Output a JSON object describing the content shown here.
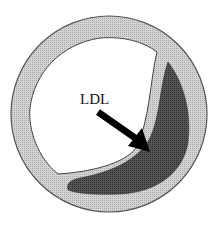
{
  "diagram": {
    "labels": {
      "ldl": "LDL"
    },
    "parts": [
      {
        "id": "vessel-wall",
        "description": "outer arterial wall ring (light stippled gray)"
      },
      {
        "id": "lumen",
        "description": "open white lumen"
      },
      {
        "id": "plaque",
        "description": "dark crescent plaque deposit"
      },
      {
        "id": "arrow",
        "description": "black arrow pointing from LDL label into plaque"
      }
    ],
    "colors": {
      "wall": "#c9c9c9",
      "wall_outline": "#555555",
      "lumen": "#ffffff",
      "plaque": "#4a4a4a",
      "arrow": "#000000",
      "text": "#111111"
    }
  }
}
